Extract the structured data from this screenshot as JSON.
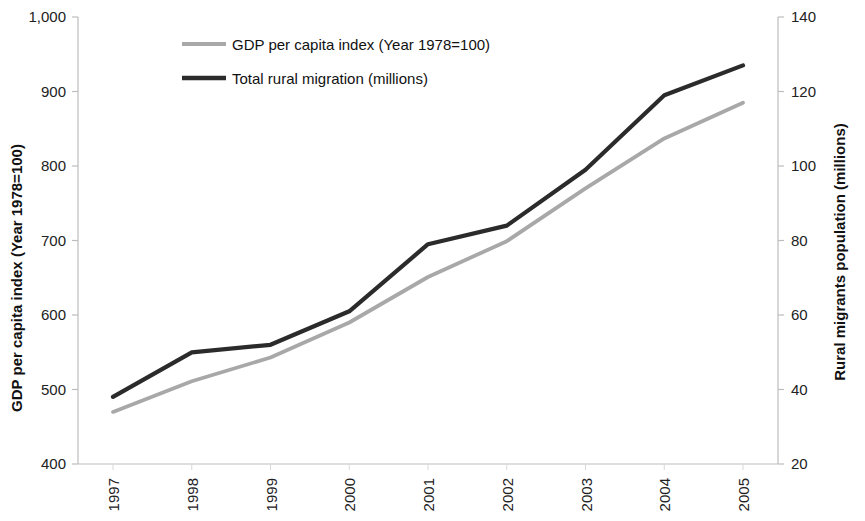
{
  "chart_data": {
    "type": "line",
    "title": "",
    "subtitle": "",
    "xlabel": "",
    "categories": [
      "1997",
      "1998",
      "1999",
      "2000",
      "2001",
      "2002",
      "2003",
      "2004",
      "2005"
    ],
    "grid": false,
    "legend_position": "top-left",
    "axes": {
      "left": {
        "label": "GDP per capita index (Year 1978=100)",
        "ticks": [
          "400",
          "500",
          "600",
          "700",
          "800",
          "900",
          "1,000"
        ],
        "tick_values": [
          400,
          500,
          600,
          700,
          800,
          900,
          1000
        ],
        "min": 400,
        "max": 1000,
        "step": 100
      },
      "right": {
        "label": "Rural migrants population (millions)",
        "ticks": [
          "20",
          "40",
          "60",
          "80",
          "100",
          "120",
          "140"
        ],
        "tick_values": [
          20,
          40,
          60,
          80,
          100,
          120,
          140
        ],
        "min": 20,
        "max": 140,
        "step": 20
      }
    },
    "series": [
      {
        "name": "GDP per capita index (Year 1978=100)",
        "axis": "left",
        "color": "#a8a8a8",
        "values": [
          470,
          511,
          543,
          590,
          651,
          699,
          770,
          837,
          885
        ]
      },
      {
        "name": "Total rural migration (millions)",
        "axis": "right",
        "color": "#2b2b2b",
        "values": [
          38,
          50,
          52,
          61,
          79,
          84,
          99,
          119,
          127
        ]
      }
    ]
  },
  "legend": {
    "items": [
      {
        "label": "GDP per capita index (Year 1978=100)",
        "color": "#a8a8a8"
      },
      {
        "label": "Total rural migration (millions)",
        "color": "#2b2b2b"
      }
    ]
  }
}
